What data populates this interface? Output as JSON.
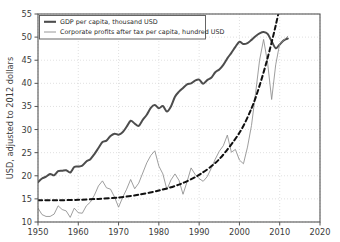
{
  "chart_data": {
    "type": "line",
    "title": "",
    "xlabel": "",
    "ylabel": "USD, adjusted to 2012 dollars",
    "xlim": [
      1950,
      2020
    ],
    "ylim": [
      10,
      55
    ],
    "xticks": [
      "1950",
      "1960",
      "1970",
      "1980",
      "1990",
      "2000",
      "2010",
      "2020"
    ],
    "yticks": [
      "10",
      "15",
      "20",
      "25",
      "30",
      "35",
      "40",
      "45",
      "50",
      "55"
    ],
    "grid": true,
    "legend_position": "upper left",
    "legend": [
      "GDP per capita, thousand USD",
      "Corporate profits after tax per capita, hundred USD"
    ],
    "colors": {
      "gdp_line": "#4d4d4d",
      "profits_line": "#8c8c8c",
      "trend_line": "#111111",
      "grid": "#cccccc",
      "axis": "#555555",
      "background": "#ffffff"
    },
    "series": [
      {
        "name": "GDP per capita, thousand USD",
        "style": "solid-thick",
        "color": "#4d4d4d",
        "x": [
          1950,
          1951,
          1952,
          1953,
          1954,
          1955,
          1956,
          1957,
          1958,
          1959,
          1960,
          1961,
          1962,
          1963,
          1964,
          1965,
          1966,
          1967,
          1968,
          1969,
          1970,
          1971,
          1972,
          1973,
          1974,
          1975,
          1976,
          1977,
          1978,
          1979,
          1980,
          1981,
          1982,
          1983,
          1984,
          1985,
          1986,
          1987,
          1988,
          1989,
          1990,
          1991,
          1992,
          1993,
          1994,
          1995,
          1996,
          1997,
          1998,
          1999,
          2000,
          2001,
          2002,
          2003,
          2004,
          2005,
          2006,
          2007,
          2008,
          2009,
          2010,
          2011,
          2012
        ],
        "y": [
          18.6,
          19.7,
          20.1,
          20.7,
          20.3,
          21.4,
          21.5,
          21.6,
          21.1,
          22.3,
          22.5,
          22.6,
          23.6,
          24.3,
          25.4,
          26.7,
          28.1,
          28.4,
          29.4,
          29.9,
          29.5,
          30.1,
          31.4,
          32.8,
          32.2,
          31.7,
          33.0,
          34.1,
          35.6,
          36.2,
          35.5,
          36.0,
          34.8,
          35.9,
          38.1,
          39.2,
          40.0,
          40.9,
          41.0,
          41.7,
          41.9,
          41.0,
          41.8,
          42.3,
          43.5,
          44.1,
          45.1,
          46.5,
          47.8,
          49.2,
          50.5,
          50.0,
          50.2,
          50.9,
          52.3,
          53.6,
          54.3,
          54.3,
          53.1,
          50.9,
          51.5,
          51.8,
          52.2
        ],
        "y_plot": [
          18.6,
          19.4,
          19.8,
          20.4,
          20.1,
          21.0,
          21.1,
          21.2,
          20.7,
          21.9,
          22.0,
          22.2,
          23.1,
          23.6,
          24.7,
          26.0,
          27.3,
          27.6,
          28.6,
          29.1,
          28.9,
          29.4,
          30.6,
          31.9,
          31.3,
          30.8,
          32.1,
          33.2,
          34.7,
          35.3,
          34.6,
          35.1,
          33.9,
          35.0,
          37.1,
          38.2,
          39.0,
          39.8,
          40.0,
          40.6,
          40.8,
          39.9,
          40.7,
          41.2,
          42.4,
          43.0,
          44.0,
          45.4,
          46.6,
          47.9,
          49.0,
          48.5,
          48.7,
          49.4,
          50.2,
          50.8,
          51.1,
          50.7,
          49.1,
          47.6,
          48.4,
          49.3,
          49.7
        ]
      },
      {
        "name": "Corporate profits after tax per capita, hundred USD",
        "style": "solid-thin",
        "color": "#8c8c8c",
        "x": [
          1950,
          1951,
          1952,
          1953,
          1954,
          1955,
          1956,
          1957,
          1958,
          1959,
          1960,
          1961,
          1962,
          1963,
          1964,
          1965,
          1966,
          1967,
          1968,
          1969,
          1970,
          1971,
          1972,
          1973,
          1974,
          1975,
          1976,
          1977,
          1978,
          1979,
          1980,
          1981,
          1982,
          1983,
          1984,
          1985,
          1986,
          1987,
          1988,
          1989,
          1990,
          1991,
          1992,
          1993,
          1994,
          1995,
          1996,
          1997,
          1998,
          1999,
          2000,
          2001,
          2002,
          2003,
          2004,
          2005,
          2006,
          2007,
          2008,
          2009,
          2010,
          2011,
          2012
        ],
        "y": [
          13.0,
          11.6,
          11.2,
          11.2,
          11.7,
          13.5,
          12.7,
          12.4,
          11.0,
          13.0,
          12.0,
          11.9,
          13.5,
          14.3,
          15.8,
          17.8,
          18.9,
          17.4,
          17.1,
          15.4,
          13.2,
          15.3,
          17.1,
          19.2,
          17.2,
          18.4,
          20.6,
          22.8,
          24.4,
          25.4,
          22.1,
          20.4,
          17.0,
          19.1,
          20.4,
          19.0,
          16.0,
          18.7,
          21.7,
          20.3,
          19.4,
          18.8,
          19.8,
          21.6,
          23.6,
          25.3,
          26.5,
          28.8,
          25.1,
          25.7,
          23.4,
          22.6,
          26.2,
          30.9,
          37.8,
          45.0,
          49.5,
          44.4,
          36.5,
          44.0,
          48.6,
          49.3,
          52.0
        ],
        "y_plot": [
          13.0,
          11.6,
          11.2,
          11.2,
          11.7,
          13.5,
          12.7,
          12.4,
          11.0,
          13.0,
          12.0,
          11.9,
          13.5,
          14.3,
          15.8,
          17.8,
          18.9,
          17.4,
          17.1,
          15.4,
          13.2,
          15.3,
          17.1,
          19.2,
          17.2,
          18.4,
          20.6,
          22.8,
          24.4,
          25.4,
          22.1,
          20.4,
          17.0,
          19.1,
          20.4,
          19.0,
          16.0,
          18.7,
          21.7,
          20.3,
          19.4,
          18.8,
          19.8,
          21.6,
          23.6,
          25.3,
          26.5,
          28.8,
          25.1,
          25.7,
          23.4,
          22.6,
          26.2,
          30.9,
          37.8,
          45.0,
          49.5,
          44.4,
          36.5,
          44.0,
          48.6,
          49.3,
          50.2
        ]
      },
      {
        "name": "exponential trend",
        "style": "dashed",
        "color": "#111111",
        "x": [
          1950,
          1955,
          1960,
          1965,
          1970,
          1975,
          1980,
          1985,
          1990,
          1995,
          2000,
          2003,
          2005,
          2007,
          2009,
          2011,
          2012
        ],
        "y": [
          14.7,
          14.7,
          14.8,
          15.0,
          15.3,
          15.9,
          16.8,
          18.1,
          20.2,
          23.6,
          29.3,
          34.6,
          39.5,
          45.5,
          52.5,
          60.5,
          65.0
        ],
        "y_plot": [
          14.7,
          14.7,
          14.8,
          15.0,
          15.3,
          15.9,
          16.8,
          18.1,
          20.2,
          23.6,
          29.3,
          34.6,
          39.5,
          45.5,
          52.5,
          60.5,
          65.0
        ]
      }
    ]
  }
}
